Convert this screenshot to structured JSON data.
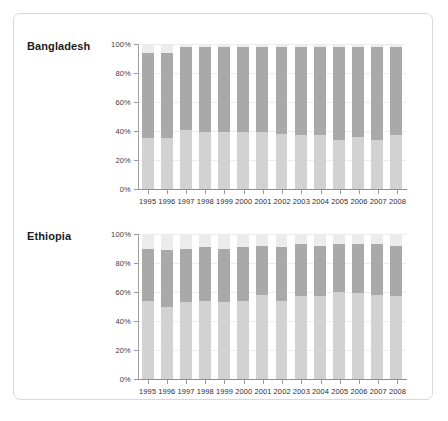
{
  "figure": {
    "panels": [
      {
        "label": "Bangladesh",
        "name": "panel-bangladesh"
      },
      {
        "label": "Ethiopia",
        "name": "panel-ethiopia"
      }
    ]
  },
  "axis": {
    "y_ticks": [
      "100%",
      "80%",
      "60%",
      "40%",
      "20%",
      "0%"
    ],
    "y_values": [
      100,
      80,
      60,
      40,
      20,
      0
    ],
    "x_labels": [
      "1995",
      "1996",
      "1997",
      "1998",
      "1999",
      "2000",
      "2001",
      "2002",
      "2003",
      "2004",
      "2005",
      "2006",
      "2007",
      "2008"
    ]
  },
  "colors": {
    "segment_bottom": "#d2d2d2",
    "segment_middle": "#a9a9a9",
    "segment_top": "#ececec",
    "gridline": "#ededed",
    "axis": "#9a9a9a",
    "frame_border": "#d9d9d9",
    "text": "#2f2f2f"
  },
  "chart_data": [
    {
      "type": "bar",
      "stacked": true,
      "title": "Bangladesh",
      "xlabel": "",
      "ylabel": "",
      "ylim": [
        0,
        100
      ],
      "grid": true,
      "legend": "none",
      "categories": [
        "1995",
        "1996",
        "1997",
        "1998",
        "1999",
        "2000",
        "2001",
        "2002",
        "2003",
        "2004",
        "2005",
        "2006",
        "2007",
        "2008"
      ],
      "series": [
        {
          "name": "lower-segment",
          "color": "#d2d2d2",
          "values": [
            35,
            35,
            41,
            39,
            39,
            39,
            39,
            38,
            37,
            37,
            34,
            36,
            34,
            37
          ]
        },
        {
          "name": "middle-segment",
          "color": "#a9a9a9",
          "values": [
            59,
            59,
            57,
            59,
            59,
            59,
            59,
            60,
            61,
            61,
            64,
            62,
            64,
            61
          ]
        },
        {
          "name": "upper-segment",
          "color": "#ececec",
          "values": [
            6,
            6,
            2,
            2,
            2,
            2,
            2,
            2,
            2,
            2,
            2,
            2,
            2,
            2
          ]
        }
      ]
    },
    {
      "type": "bar",
      "stacked": true,
      "title": "Ethiopia",
      "xlabel": "",
      "ylabel": "",
      "ylim": [
        0,
        100
      ],
      "grid": true,
      "legend": "none",
      "categories": [
        "1995",
        "1996",
        "1997",
        "1998",
        "1999",
        "2000",
        "2001",
        "2002",
        "2003",
        "2004",
        "2005",
        "2006",
        "2007",
        "2008"
      ],
      "series": [
        {
          "name": "lower-segment",
          "color": "#d2d2d2",
          "values": [
            54,
            50,
            53,
            54,
            53,
            54,
            58,
            54,
            57,
            57,
            60,
            59,
            58,
            57
          ]
        },
        {
          "name": "middle-segment",
          "color": "#a9a9a9",
          "values": [
            36,
            39,
            37,
            37,
            37,
            37,
            34,
            37,
            36,
            35,
            33,
            34,
            35,
            35
          ]
        },
        {
          "name": "upper-segment",
          "color": "#ececec",
          "values": [
            10,
            11,
            10,
            9,
            10,
            9,
            8,
            9,
            7,
            8,
            7,
            7,
            7,
            8
          ]
        }
      ]
    }
  ]
}
